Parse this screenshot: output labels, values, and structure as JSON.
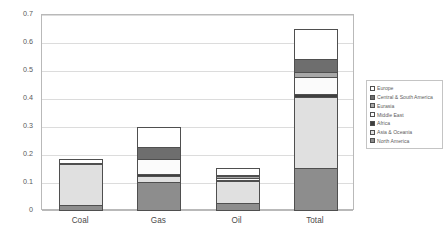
{
  "chart_data": {
    "type": "bar",
    "subtype": "stacked-column",
    "title": "",
    "xlabel": "",
    "ylabel": "GtCO2e",
    "ylim": [
      0,
      0.7
    ],
    "ytick_values": [
      0,
      0.1,
      0.2,
      0.3,
      0.4,
      0.5,
      0.6,
      0.7
    ],
    "ytick_labels": [
      "0",
      "0.1",
      "0.2",
      "0.3",
      "0.4",
      "0.5",
      "0.6",
      "0.7"
    ],
    "grid": true,
    "grid_axis": "y",
    "legend_position": "right",
    "categories": [
      "Coal",
      "Gas",
      "Oil",
      "Total"
    ],
    "series": [
      {
        "name": "North America",
        "color": "#8d8d8d",
        "values": [
          0.022,
          0.102,
          0.029,
          0.152
        ]
      },
      {
        "name": "Asia & Oceania",
        "color": "#e0e0e0",
        "values": [
          0.147,
          0.024,
          0.079,
          0.256
        ]
      },
      {
        "name": "Africa",
        "color": "#3f3f3f",
        "values": [
          0.004,
          0.005,
          0.003,
          0.01
        ]
      },
      {
        "name": "Middle East",
        "color": "#fbfbfb",
        "values": [
          0.0,
          0.054,
          0.007,
          0.06
        ]
      },
      {
        "name": "Eurasia",
        "color": "#a8a8a8",
        "values": [
          0.0,
          0.0,
          0.006,
          0.019
        ]
      },
      {
        "name": "Central & South America",
        "color": "#6e6e6e",
        "values": [
          0.0,
          0.043,
          0.006,
          0.045
        ]
      },
      {
        "name": "Europe",
        "color": "#ffffff",
        "values": [
          0.013,
          0.072,
          0.022,
          0.108
        ]
      }
    ],
    "totals": [
      0.186,
      0.3,
      0.152,
      0.64
    ]
  },
  "axes": {
    "y_title": "GtCO2e",
    "y_ticks": [
      "0.7",
      "0.6",
      "0.5",
      "0.4",
      "0.3",
      "0.2",
      "0.1",
      "0"
    ],
    "x_ticks": [
      "Coal",
      "Gas",
      "Oil",
      "Total"
    ]
  },
  "legend": {
    "items": [
      {
        "label": "Europe"
      },
      {
        "label": "Central & South America"
      },
      {
        "label": "Eurasia"
      },
      {
        "label": "Middle East"
      },
      {
        "label": "Africa"
      },
      {
        "label": "Asia & Oceania"
      },
      {
        "label": "North America"
      }
    ]
  }
}
